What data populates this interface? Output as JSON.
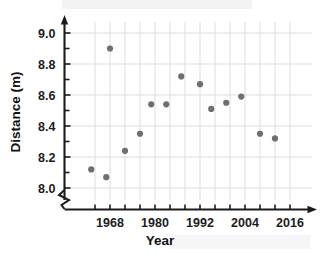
{
  "chart_data": {
    "type": "scatter",
    "title": "",
    "xlabel": "Year",
    "ylabel": "Distance (m)",
    "xlim": [
      1960,
      2019
    ],
    "ylim": [
      7.93,
      9.06
    ],
    "grid": true,
    "legend": null,
    "x_ticks_major": [
      1968,
      1980,
      1992,
      2004,
      2016
    ],
    "x_tick_labels": [
      "1968",
      "1980",
      "1992",
      "2004",
      "2016"
    ],
    "x_ticks_minor": [
      1964,
      1972,
      1976,
      1984,
      1988,
      1996,
      2000,
      2008,
      2012
    ],
    "y_ticks": [
      8.0,
      8.2,
      8.4,
      8.6,
      8.8,
      9.0
    ],
    "y_tick_labels": [
      "8.0",
      "8.2",
      "8.4",
      "8.6",
      "8.8",
      "9.0"
    ],
    "y_axis_broken": true,
    "point_color": "#6f6f73",
    "grid_color": "#d9d9e2",
    "axis_color": "#1b1b1b",
    "x": [
      1964,
      1968,
      1972,
      1976,
      1980,
      1984,
      1988,
      1992,
      1994,
      1996,
      2000,
      2004,
      2006,
      2008,
      2012
    ],
    "y": [
      8.12,
      8.07,
      8.9,
      8.24,
      8.35,
      8.54,
      8.54,
      8.72,
      8.67,
      8.51,
      8.55,
      8.59,
      8.35,
      8.32,
      8.32
    ],
    "points": [
      {
        "year": 1963,
        "distance": 8.12
      },
      {
        "year": 1967,
        "distance": 8.07
      },
      {
        "year": 1968,
        "distance": 8.9
      },
      {
        "year": 1972,
        "distance": 8.24
      },
      {
        "year": 1976,
        "distance": 8.35
      },
      {
        "year": 1979,
        "distance": 8.54
      },
      {
        "year": 1983,
        "distance": 8.54
      },
      {
        "year": 1987,
        "distance": 8.72
      },
      {
        "year": 1992,
        "distance": 8.67
      },
      {
        "year": 1995,
        "distance": 8.51
      },
      {
        "year": 1999,
        "distance": 8.55
      },
      {
        "year": 2003,
        "distance": 8.59
      },
      {
        "year": 2008,
        "distance": 8.35
      },
      {
        "year": 2012,
        "distance": 8.32
      }
    ]
  }
}
